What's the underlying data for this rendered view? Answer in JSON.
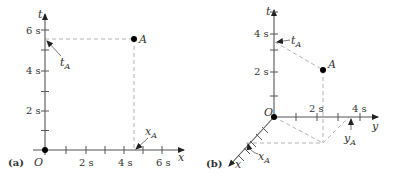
{
  "panel_a": {
    "tag": "(a)",
    "origin_label": "O",
    "t_axis_label": "t",
    "x_axis_label": "x",
    "t_ticks": [
      "2 s",
      "4 s",
      "6 s"
    ],
    "x_ticks": [
      "2 s",
      "4 s",
      "6 s"
    ],
    "point_label": "A",
    "t_proj_label": "t",
    "t_proj_sub": "A",
    "x_proj_label": "x",
    "x_proj_sub": "A"
  },
  "panel_b": {
    "tag": "(b)",
    "origin_label": "O",
    "t_axis_label": "t",
    "y_axis_label": "y",
    "x_axis_label": "x",
    "t_ticks": [
      "2 s",
      "4 s"
    ],
    "y_ticks": [
      "2 s",
      "4 s"
    ],
    "point_label": "A",
    "t_proj_label": "t",
    "t_proj_sub": "A",
    "x_proj_label": "x",
    "x_proj_sub": "A",
    "y_proj_label": "y",
    "y_proj_sub": "A"
  },
  "colors": {
    "axis": "#555555",
    "dashed": "#aaaaaa",
    "point": "#000000",
    "text": "#333333"
  }
}
